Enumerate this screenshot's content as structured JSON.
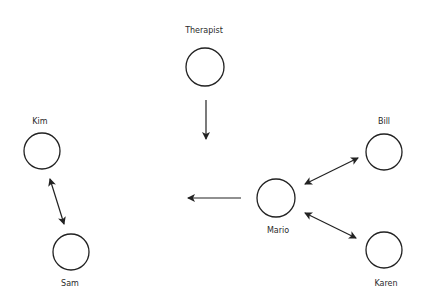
{
  "diagram": {
    "nodes": [
      {
        "id": "therapist",
        "label": "Therapist",
        "cx": 205,
        "cy": 67,
        "r": 19,
        "label_x": 204,
        "label_y": 30
      },
      {
        "id": "kim",
        "label": "Kim",
        "cx": 42,
        "cy": 151,
        "r": 18,
        "label_x": 40,
        "label_y": 121
      },
      {
        "id": "sam",
        "label": "Sam",
        "cx": 71,
        "cy": 252,
        "r": 18,
        "label_x": 70,
        "label_y": 283
      },
      {
        "id": "mario",
        "label": "Mario",
        "cx": 276,
        "cy": 198,
        "r": 19,
        "label_x": 278,
        "label_y": 230
      },
      {
        "id": "bill",
        "label": "Bill",
        "cx": 384,
        "cy": 152,
        "r": 18,
        "label_x": 384,
        "label_y": 121
      },
      {
        "id": "karen",
        "label": "Karen",
        "cx": 384,
        "cy": 250,
        "r": 18,
        "label_x": 386,
        "label_y": 283
      }
    ],
    "edges": [
      {
        "from": "therapist",
        "to": "center",
        "type": "one-way",
        "x1": 206,
        "y1": 100,
        "x2": 206,
        "y2": 139
      },
      {
        "from": "mario",
        "to": "left",
        "type": "one-way",
        "x1": 241,
        "y1": 198,
        "x2": 188,
        "y2": 198
      },
      {
        "from": "kim",
        "to": "sam",
        "type": "two-way",
        "x1": 50,
        "y1": 179,
        "x2": 64,
        "y2": 224
      },
      {
        "from": "mario",
        "to": "bill",
        "type": "two-way",
        "x1": 305,
        "y1": 184,
        "x2": 358,
        "y2": 158
      },
      {
        "from": "mario",
        "to": "karen",
        "type": "two-way",
        "x1": 305,
        "y1": 213,
        "x2": 356,
        "y2": 238
      }
    ],
    "stroke_color": "#222222"
  }
}
